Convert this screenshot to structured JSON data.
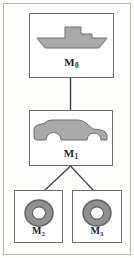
{
  "figure": {
    "background_color": "#fdfdfc",
    "frame_color": "#b6b4b0",
    "box_border_color": "#6d6b69",
    "edge_color": "#3b3b3b",
    "shape_fill": "#a9a9a9",
    "shape_stroke": "#6e6e6e",
    "wheel_ring_color": "#909090",
    "wheel_ring_stroke": "#5d5d5d",
    "wheel_hub_color": "#ffffff"
  },
  "nodes": [
    {
      "id": "m0",
      "label": "M",
      "subscript": "0",
      "icon": "boat-icon",
      "icon_description": "gray boat silhouette with raised cabin"
    },
    {
      "id": "m1",
      "label": "M",
      "subscript": "1",
      "icon": "car-icon",
      "icon_description": "gray suv car silhouette with wheel arches"
    },
    {
      "id": "m2",
      "label": "M",
      "subscript": "2",
      "icon": "wheel-icon",
      "icon_description": "gray annulus wheel with white hub"
    },
    {
      "id": "m3",
      "label": "M",
      "subscript": "3",
      "icon": "wheel-icon",
      "icon_description": "gray annulus wheel with white hub"
    }
  ],
  "edges": [
    {
      "from": "m0",
      "to": "m1",
      "kind": "vertical"
    },
    {
      "from": "m1",
      "to": "m2",
      "kind": "diagonal"
    },
    {
      "from": "m1",
      "to": "m3",
      "kind": "diagonal"
    }
  ]
}
